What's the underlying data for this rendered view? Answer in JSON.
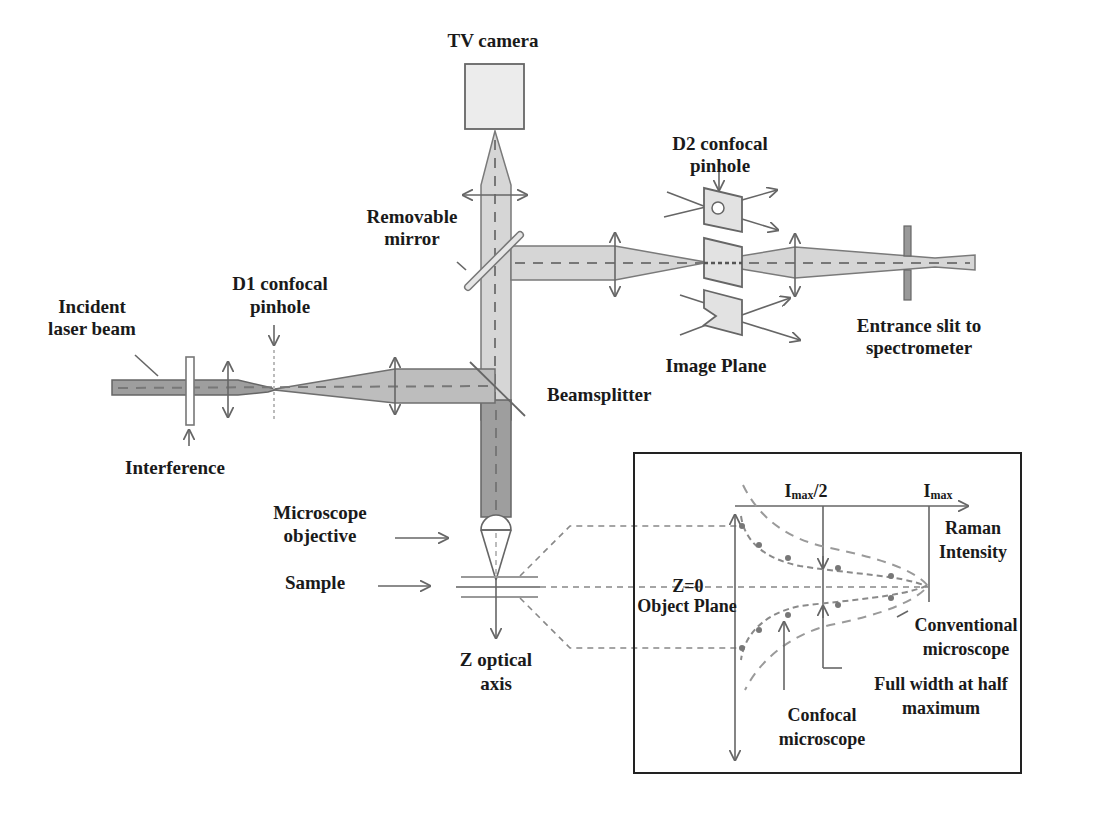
{
  "labels": {
    "tv_camera": "TV camera",
    "d2_pinhole_line1": "D2 confocal",
    "d2_pinhole_line2": "pinhole",
    "removable_mirror_line1": "Removable",
    "removable_mirror_line2": "mirror",
    "d1_pinhole_line1": "D1 confocal",
    "d1_pinhole_line2": "pinhole",
    "incident_line1": "Incident",
    "incident_line2": "laser beam",
    "entrance_slit_line1": "Entrance slit to",
    "entrance_slit_line2": "spectrometer",
    "image_plane": "Image Plane",
    "beamsplitter": "Beamsplitter",
    "interference": "Interference",
    "microscope_objective_line1": "Microscope",
    "microscope_objective_line2": "objective",
    "sample": "Sample",
    "z_axis_line1": "Z optical",
    "z_axis_line2": "axis"
  },
  "inset": {
    "imax_half": "I",
    "imax_half_sub": "max",
    "imax_half_suffix": "/2",
    "imax": "I",
    "imax_sub": "max",
    "raman_line1": "Raman",
    "raman_line2": "Intensity",
    "z0": "Z=0",
    "object_plane": "Object Plane",
    "conventional_line1": "Conventional",
    "conventional_line2": "microscope",
    "fwhm_line1": "Full width at half",
    "fwhm_line2": "maximum",
    "confocal_line1": "Confocal",
    "confocal_line2": "microscope"
  }
}
